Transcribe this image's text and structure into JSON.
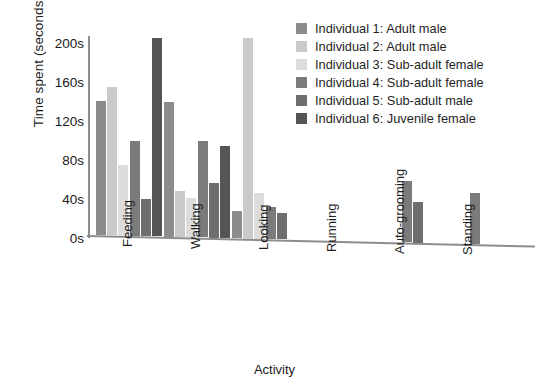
{
  "chart_data": {
    "type": "bar",
    "title": "",
    "xlabel": "Activity",
    "ylabel": "Time spent (seconds)",
    "categories": [
      "Feeding",
      "Walking",
      "Looking",
      "Running",
      "Auto-grooming",
      "Standing"
    ],
    "ylim": [
      0,
      210
    ],
    "yticks": [
      0,
      40,
      80,
      120,
      160,
      200
    ],
    "ytick_labels": [
      "0s",
      "40s",
      "80s",
      "120s",
      "160s",
      "200s"
    ],
    "grid": false,
    "legend_position": "top-right",
    "series": [
      {
        "name": "Individual 1: Adult male",
        "color": "#8c8c8c",
        "values": [
          137,
          138,
          28,
          0,
          0,
          0
        ]
      },
      {
        "name": "Individual 2: Adult male",
        "color": "#c9c9c9",
        "values": [
          152,
          47,
          205,
          0,
          0,
          0
        ]
      },
      {
        "name": "Individual 3: Sub-adult female",
        "color": "#dcdcdc",
        "values": [
          72,
          40,
          47,
          0,
          0,
          0
        ]
      },
      {
        "name": "Individual 4: Sub-adult female",
        "color": "#7b7b7b",
        "values": [
          97,
          99,
          33,
          0,
          63,
          52
        ]
      },
      {
        "name": "Individual 5: Sub-adult male",
        "color": "#6e6e6e",
        "values": [
          38,
          56,
          27,
          0,
          42,
          0
        ]
      },
      {
        "name": "Individual 6: Juvenile female",
        "color": "#555555",
        "values": [
          203,
          94,
          0,
          0,
          0,
          0
        ]
      }
    ]
  },
  "legend": {
    "items": [
      {
        "label": "Individual 1: Adult male"
      },
      {
        "label": "Individual 2: Adult male"
      },
      {
        "label": "Individual 3: Sub-adult female"
      },
      {
        "label": "Individual 4: Sub-adult female"
      },
      {
        "label": "Individual 5: Sub-adult male"
      },
      {
        "label": "Individual 6: Juvenile female"
      }
    ]
  }
}
